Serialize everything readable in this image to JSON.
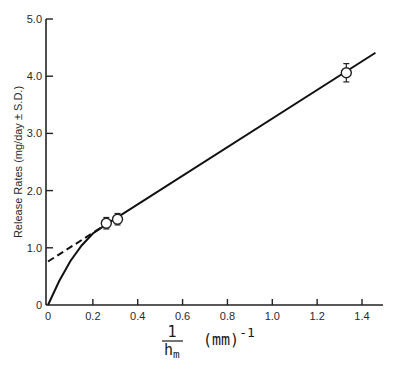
{
  "chart_data": {
    "type": "line",
    "title": "",
    "xlabel": "1/h_m (mm)^-1",
    "xlabel_parts": {
      "numerator": "1",
      "denominator": "h",
      "subscript": "m",
      "unit": "(mm)",
      "exponent": "-1"
    },
    "ylabel": "Release Rates (mg/day ± S.D.)",
    "xlim": [
      0,
      1.5
    ],
    "ylim": [
      0,
      5.0
    ],
    "x_ticks": [
      0,
      0.2,
      0.4,
      0.6,
      0.8,
      1.0,
      1.2,
      1.4
    ],
    "x_tick_labels": [
      "0",
      "0.2",
      "0.4",
      "0.6",
      "0.8",
      "1.0",
      "1.2",
      "1.4"
    ],
    "y_ticks": [
      0,
      1.0,
      2.0,
      3.0,
      4.0,
      5.0
    ],
    "y_tick_labels": [
      "0",
      "1.0",
      "2.0",
      "3.0",
      "4.0",
      "5.0"
    ],
    "grid": false,
    "legend": null,
    "series": [
      {
        "name": "Measured release rates",
        "style": "open-circle-markers-with-error-bars",
        "points": [
          {
            "x": 0.26,
            "y": 1.43,
            "sd": 0.1
          },
          {
            "x": 0.31,
            "y": 1.5,
            "sd": 0.1
          },
          {
            "x": 1.33,
            "y": 4.06,
            "sd": 0.16
          }
        ]
      },
      {
        "name": "Linear fit",
        "style": "solid",
        "x": [
          0.26,
          1.46
        ],
        "y": [
          1.41,
          4.41
        ]
      },
      {
        "name": "Linear extrapolation",
        "style": "dashed",
        "x": [
          0,
          0.26
        ],
        "y": [
          0.76,
          1.41
        ]
      },
      {
        "name": "Curved fit from origin",
        "style": "solid",
        "x": [
          0,
          0.05,
          0.1,
          0.15,
          0.2,
          0.26
        ],
        "y": [
          0,
          0.42,
          0.77,
          1.04,
          1.25,
          1.41
        ]
      }
    ]
  }
}
